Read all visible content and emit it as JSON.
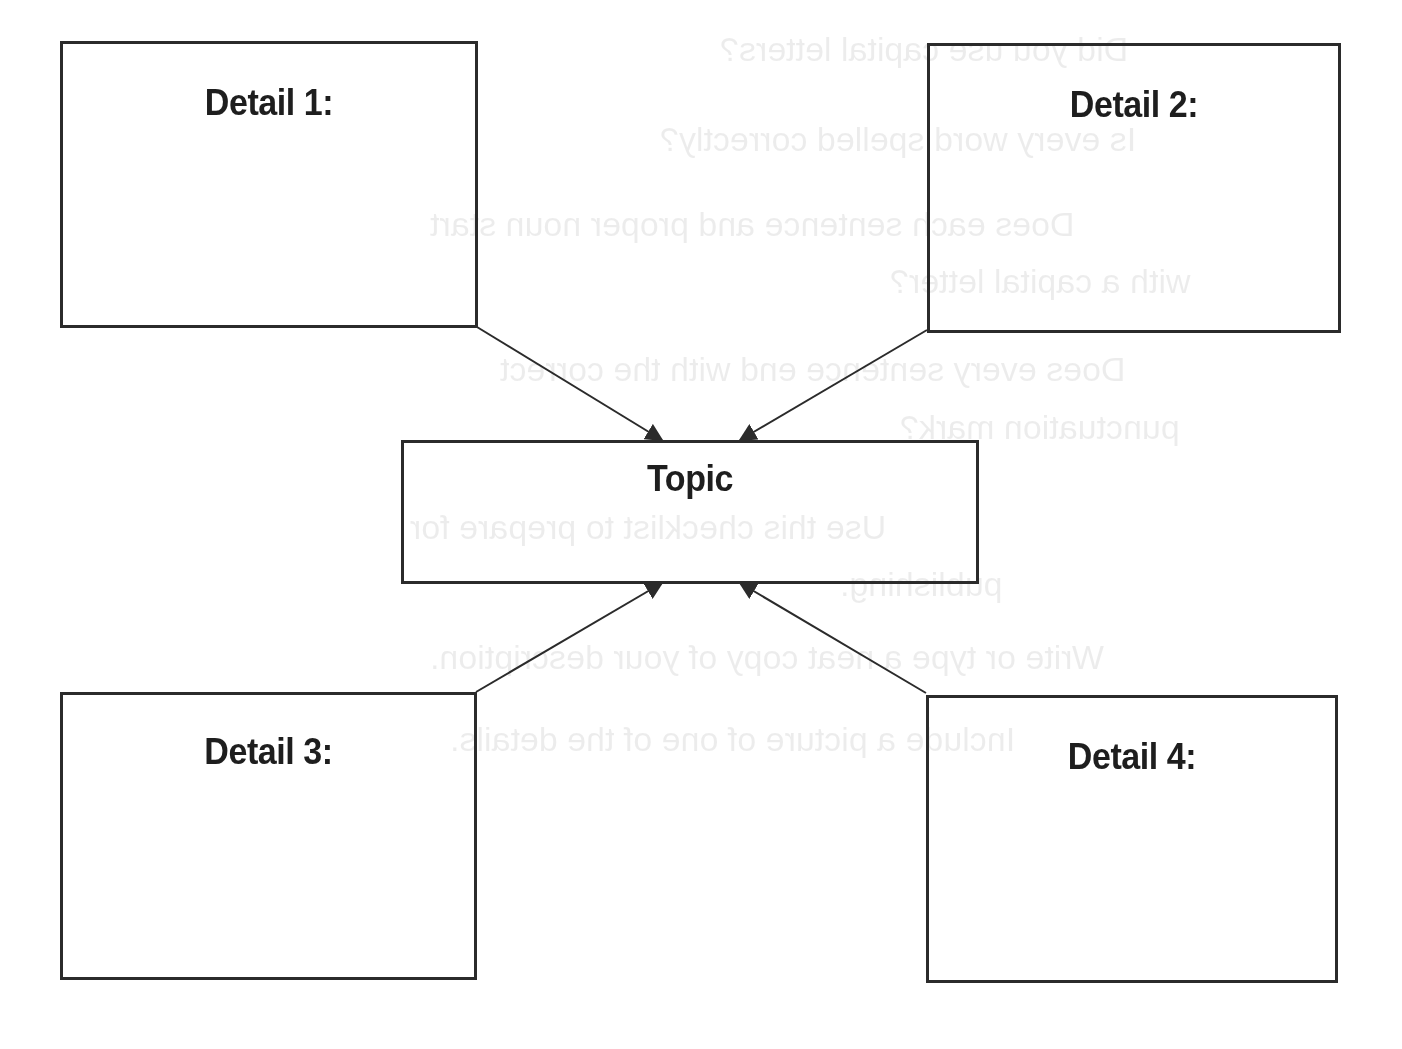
{
  "diagram": {
    "type": "graphic-organizer",
    "center": {
      "label": "Topic"
    },
    "details": [
      {
        "label": "Detail 1:",
        "position": "top-left"
      },
      {
        "label": "Detail 2:",
        "position": "top-right"
      },
      {
        "label": "Detail 3:",
        "position": "bottom-left"
      },
      {
        "label": "Detail 4:",
        "position": "bottom-right"
      }
    ],
    "edges": [
      {
        "from": "Detail 1:",
        "to": "Topic"
      },
      {
        "from": "Detail 2:",
        "to": "Topic"
      },
      {
        "from": "Detail 3:",
        "to": "Topic"
      },
      {
        "from": "Detail 4:",
        "to": "Topic"
      }
    ],
    "colors": {
      "stroke": "#2b2b2b",
      "text": "#1e1e1e",
      "background": "#ffffff"
    }
  },
  "bleed_through": [
    "Did you use capital letters?",
    "Is every word spelled correctly?",
    "Does each sentence and proper noun start",
    "with a capital letter?",
    "Does every sentence end with the correct",
    "punctuation mark?",
    "Use this checklist to prepare for",
    "publishing.",
    "Write or type a neat copy of your description.",
    "Include a picture of one of the details."
  ]
}
